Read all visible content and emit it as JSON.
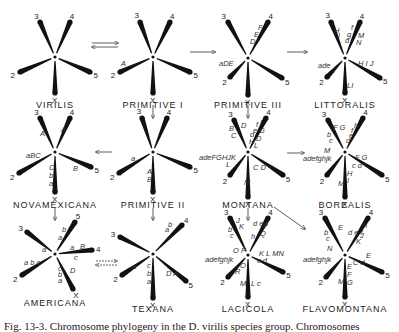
{
  "caption": "Fig. 13-3. Chromosome phylogeny in the D. virilis species group. Chromosomes",
  "species": [
    {
      "name": "VIRILIS",
      "cx": 55,
      "cy": 57,
      "arms": [
        {
          "id": "3",
          "x": 40,
          "y": 22
        },
        {
          "id": "4",
          "x": 70,
          "y": 22
        },
        {
          "id": "2",
          "x": 20,
          "y": 72
        },
        {
          "id": "5",
          "x": 90,
          "y": 72
        },
        {
          "id": "X",
          "x": 55,
          "y": 93
        }
      ],
      "labels": []
    },
    {
      "name": "PRIMITIVE I",
      "cx": 153,
      "cy": 57,
      "arms": [
        {
          "id": "3",
          "x": 140,
          "y": 22
        },
        {
          "id": "4",
          "x": 170,
          "y": 22
        },
        {
          "id": "2",
          "x": 120,
          "y": 72
        },
        {
          "id": "5",
          "x": 190,
          "y": 72
        },
        {
          "id": "X",
          "x": 153,
          "y": 93
        }
      ],
      "labels": [
        {
          "t": "A",
          "x": 121,
          "y": 66
        }
      ]
    },
    {
      "name": "PRIMITIVE III",
      "cx": 248,
      "cy": 58,
      "arms": [
        {
          "id": "3",
          "x": 228,
          "y": 22
        },
        {
          "id": "4",
          "x": 268,
          "y": 22
        },
        {
          "id": "2",
          "x": 230,
          "y": 77
        },
        {
          "id": "5",
          "x": 282,
          "y": 78
        },
        {
          "id": "X",
          "x": 248,
          "y": 95
        }
      ],
      "labels": [
        {
          "t": "F",
          "x": 258,
          "y": 30
        },
        {
          "t": "E",
          "x": 254,
          "y": 37
        },
        {
          "t": "D",
          "x": 250,
          "y": 44
        },
        {
          "t": "aDE",
          "x": 219,
          "y": 66
        }
      ]
    },
    {
      "name": "LITTORALIS",
      "cx": 345,
      "cy": 58,
      "arms": [
        {
          "id": "3",
          "x": 331,
          "y": 22
        },
        {
          "id": "4",
          "x": 360,
          "y": 22
        },
        {
          "id": "2",
          "x": 327,
          "y": 77
        },
        {
          "id": "5",
          "x": 380,
          "y": 78
        },
        {
          "id": "X",
          "x": 345,
          "y": 93
        }
      ],
      "labels": [
        {
          "t": "H",
          "x": 334,
          "y": 33
        },
        {
          "t": "I",
          "x": 338,
          "y": 38
        },
        {
          "t": "f",
          "x": 351,
          "y": 30
        },
        {
          "t": "g",
          "x": 347,
          "y": 37
        },
        {
          "t": "d",
          "x": 345,
          "y": 43
        },
        {
          "t": "M",
          "x": 358,
          "y": 38
        },
        {
          "t": "N",
          "x": 356,
          "y": 45
        },
        {
          "t": "ade",
          "x": 318,
          "y": 68
        },
        {
          "t": "I",
          "x": 333,
          "y": 73
        },
        {
          "t": "H I J",
          "x": 358,
          "y": 66
        },
        {
          "t": "LI",
          "x": 347,
          "y": 88
        }
      ]
    },
    {
      "name": "NOVAMEXICANA",
      "cx": 55,
      "cy": 152,
      "arms": [
        {
          "id": "3",
          "x": 40,
          "y": 118
        },
        {
          "id": "4",
          "x": 70,
          "y": 118
        },
        {
          "id": "2",
          "x": 19,
          "y": 173
        },
        {
          "id": "5",
          "x": 91,
          "y": 167
        },
        {
          "id": "X",
          "x": 55,
          "y": 192
        }
      ],
      "labels": [
        {
          "t": "A",
          "x": 40,
          "y": 136
        },
        {
          "t": "A",
          "x": 61,
          "y": 132
        },
        {
          "t": "aBC",
          "x": 26,
          "y": 158
        },
        {
          "t": "C",
          "x": 49,
          "y": 170
        },
        {
          "t": "b",
          "x": 49,
          "y": 178
        },
        {
          "t": "a",
          "x": 49,
          "y": 186
        },
        {
          "t": "B",
          "x": 73,
          "y": 171
        }
      ]
    },
    {
      "name": "PRIMITIVE II",
      "cx": 153,
      "cy": 152,
      "arms": [
        {
          "id": "3",
          "x": 142,
          "y": 118
        },
        {
          "id": "4",
          "x": 167,
          "y": 118
        },
        {
          "id": "2",
          "x": 119,
          "y": 173
        },
        {
          "id": "5",
          "x": 190,
          "y": 167
        },
        {
          "id": "X",
          "x": 153,
          "y": 192
        }
      ],
      "labels": [
        {
          "t": "a",
          "x": 131,
          "y": 161
        },
        {
          "t": "A",
          "x": 147,
          "y": 174
        },
        {
          "t": "B",
          "x": 147,
          "y": 182
        }
      ]
    },
    {
      "name": "MONTANA",
      "cx": 248,
      "cy": 152,
      "arms": [
        {
          "id": "3",
          "x": 234,
          "y": 120
        },
        {
          "id": "4",
          "x": 266,
          "y": 118
        },
        {
          "id": "2",
          "x": 230,
          "y": 175
        },
        {
          "id": "5",
          "x": 283,
          "y": 175
        },
        {
          "id": "X",
          "x": 248,
          "y": 197
        }
      ],
      "labels": [
        {
          "t": "B",
          "x": 229,
          "y": 131
        },
        {
          "t": "C",
          "x": 231,
          "y": 138
        },
        {
          "t": "D",
          "x": 241,
          "y": 128
        },
        {
          "t": "d",
          "x": 250,
          "y": 137
        },
        {
          "t": "e",
          "x": 253,
          "y": 133
        },
        {
          "t": "f",
          "x": 256,
          "y": 127
        },
        {
          "t": "I",
          "x": 260,
          "y": 125
        },
        {
          "t": "G",
          "x": 259,
          "y": 133
        },
        {
          "t": "H",
          "x": 249,
          "y": 144
        },
        {
          "t": "D",
          "x": 256,
          "y": 141
        },
        {
          "t": "L",
          "x": 254,
          "y": 148
        },
        {
          "t": "adeFGHJK",
          "x": 199,
          "y": 160
        },
        {
          "t": "L",
          "x": 226,
          "y": 167
        },
        {
          "t": "C D",
          "x": 253,
          "y": 170
        },
        {
          "t": "M",
          "x": 244,
          "y": 185
        }
      ]
    },
    {
      "name": "BOREALIS",
      "cx": 345,
      "cy": 152,
      "arms": [
        {
          "id": "3",
          "x": 328,
          "y": 120
        },
        {
          "id": "4",
          "x": 363,
          "y": 118
        },
        {
          "id": "2",
          "x": 327,
          "y": 175
        },
        {
          "id": "5",
          "x": 382,
          "y": 175
        },
        {
          "id": "X",
          "x": 345,
          "y": 197
        }
      ],
      "labels": [
        {
          "t": "F G",
          "x": 333,
          "y": 130
        },
        {
          "t": "b",
          "x": 327,
          "y": 137
        },
        {
          "t": "c",
          "x": 329,
          "y": 143
        },
        {
          "t": "h",
          "x": 354,
          "y": 128
        },
        {
          "t": "f",
          "x": 351,
          "y": 133
        },
        {
          "t": "e",
          "x": 349,
          "y": 138
        },
        {
          "t": "d",
          "x": 346,
          "y": 143
        },
        {
          "t": "M",
          "x": 324,
          "y": 153
        },
        {
          "t": "adefghjk",
          "x": 303,
          "y": 161
        },
        {
          "t": "F G",
          "x": 355,
          "y": 160
        },
        {
          "t": "c d",
          "x": 352,
          "y": 168
        },
        {
          "t": "H",
          "x": 347,
          "y": 176
        },
        {
          "t": "I",
          "x": 347,
          "y": 183
        },
        {
          "t": "M",
          "x": 338,
          "y": 186
        }
      ]
    },
    {
      "name": "AMERICANA",
      "cx": 55,
      "cy": 254,
      "arms": [
        {
          "id": "3",
          "x": 27,
          "y": 232
        },
        {
          "id": "5",
          "x": 75,
          "y": 222
        },
        {
          "id": "4",
          "x": 92,
          "y": 250
        },
        {
          "id": "2",
          "x": 22,
          "y": 275
        },
        {
          "id": "X",
          "x": 73,
          "y": 289
        }
      ],
      "labels": [
        {
          "t": "b",
          "x": 62,
          "y": 232
        },
        {
          "t": "a",
          "x": 58,
          "y": 240
        },
        {
          "t": "a",
          "x": 42,
          "y": 252
        },
        {
          "t": "a b c",
          "x": 24,
          "y": 265
        },
        {
          "t": "a",
          "x": 70,
          "y": 250
        },
        {
          "t": "B",
          "x": 80,
          "y": 249
        },
        {
          "t": "c",
          "x": 74,
          "y": 260
        },
        {
          "t": "c",
          "x": 58,
          "y": 271
        },
        {
          "t": "b",
          "x": 58,
          "y": 277
        },
        {
          "t": "a",
          "x": 58,
          "y": 283
        },
        {
          "t": "D",
          "x": 70,
          "y": 273
        }
      ]
    },
    {
      "name": "TEXANA",
      "cx": 153,
      "cy": 254,
      "arms": [
        {
          "id": "3",
          "x": 120,
          "y": 237
        },
        {
          "id": "4",
          "x": 182,
          "y": 225
        },
        {
          "id": "2",
          "x": 122,
          "y": 275
        },
        {
          "id": "5",
          "x": 186,
          "y": 281
        },
        {
          "id": "X",
          "x": 153,
          "y": 298
        }
      ],
      "labels": [
        {
          "t": "a",
          "x": 165,
          "y": 232
        },
        {
          "t": "b",
          "x": 168,
          "y": 227
        },
        {
          "t": "a",
          "x": 132,
          "y": 269
        },
        {
          "t": "c",
          "x": 147,
          "y": 268
        },
        {
          "t": "b",
          "x": 147,
          "y": 276
        },
        {
          "t": "a",
          "x": 147,
          "y": 284
        },
        {
          "t": "D A",
          "x": 166,
          "y": 276
        }
      ]
    },
    {
      "name": "LACICOLA",
      "cx": 248,
      "cy": 255,
      "arms": [
        {
          "id": "3",
          "x": 230,
          "y": 218
        },
        {
          "id": "4",
          "x": 268,
          "y": 218
        },
        {
          "id": "2",
          "x": 228,
          "y": 277
        },
        {
          "id": "5",
          "x": 283,
          "y": 272
        },
        {
          "id": "X",
          "x": 248,
          "y": 297
        }
      ],
      "labels": [
        {
          "t": "J",
          "x": 236,
          "y": 223
        },
        {
          "t": "K",
          "x": 239,
          "y": 229
        },
        {
          "t": "b",
          "x": 228,
          "y": 232
        },
        {
          "t": "c",
          "x": 230,
          "y": 238
        },
        {
          "t": "d e f",
          "x": 253,
          "y": 226
        },
        {
          "t": "h",
          "x": 251,
          "y": 239
        },
        {
          "t": "P",
          "x": 263,
          "y": 228
        },
        {
          "t": "Q",
          "x": 260,
          "y": 236
        },
        {
          "t": "O P",
          "x": 233,
          "y": 253
        },
        {
          "t": "adefghjk",
          "x": 205,
          "y": 262
        },
        {
          "t": "O",
          "x": 240,
          "y": 268
        },
        {
          "t": "R",
          "x": 235,
          "y": 274
        },
        {
          "t": "K L MN",
          "x": 259,
          "y": 256
        },
        {
          "t": "c d",
          "x": 257,
          "y": 263
        },
        {
          "t": "M",
          "x": 240,
          "y": 286
        },
        {
          "t": "L c",
          "x": 251,
          "y": 286
        }
      ]
    },
    {
      "name": "FLAVOMONTANA",
      "cx": 345,
      "cy": 255,
      "arms": [
        {
          "id": "3",
          "x": 325,
          "y": 218
        },
        {
          "id": "4",
          "x": 368,
          "y": 218
        },
        {
          "id": "2",
          "x": 326,
          "y": 277
        },
        {
          "id": "5",
          "x": 382,
          "y": 272
        },
        {
          "id": "X",
          "x": 345,
          "y": 297
        }
      ],
      "labels": [
        {
          "t": "E",
          "x": 338,
          "y": 230
        },
        {
          "t": "b",
          "x": 324,
          "y": 235
        },
        {
          "t": "c",
          "x": 326,
          "y": 241
        },
        {
          "t": "h",
          "x": 363,
          "y": 228
        },
        {
          "t": "d e f",
          "x": 348,
          "y": 235
        },
        {
          "t": "J",
          "x": 360,
          "y": 238
        },
        {
          "t": "K",
          "x": 356,
          "y": 244
        },
        {
          "t": "N",
          "x": 327,
          "y": 251
        },
        {
          "t": "adefghjk",
          "x": 303,
          "y": 262
        },
        {
          "t": "E",
          "x": 366,
          "y": 258
        },
        {
          "t": "C d",
          "x": 353,
          "y": 265
        },
        {
          "t": "E",
          "x": 347,
          "y": 269
        },
        {
          "t": "F",
          "x": 347,
          "y": 277
        },
        {
          "t": "G",
          "x": 347,
          "y": 285
        },
        {
          "t": "M",
          "x": 338,
          "y": 284
        }
      ]
    }
  ],
  "arrows": [
    {
      "type": "double",
      "x1": 92,
      "y1": 45,
      "x2": 118,
      "y2": 45
    },
    {
      "type": "single",
      "x1": 190,
      "y1": 52,
      "x2": 215,
      "y2": 52
    },
    {
      "type": "single",
      "x1": 287,
      "y1": 52,
      "x2": 307,
      "y2": 52
    },
    {
      "type": "single",
      "x1": 153,
      "y1": 105,
      "x2": 153,
      "y2": 118
    },
    {
      "type": "single",
      "x1": 248,
      "y1": 105,
      "x2": 248,
      "y2": 118
    },
    {
      "type": "single",
      "x1": 112,
      "y1": 152,
      "x2": 96,
      "y2": 152
    },
    {
      "type": "single",
      "x1": 287,
      "y1": 153,
      "x2": 304,
      "y2": 153
    },
    {
      "type": "single",
      "x1": 55,
      "y1": 208,
      "x2": 55,
      "y2": 220
    },
    {
      "type": "single",
      "x1": 153,
      "y1": 208,
      "x2": 153,
      "y2": 220
    },
    {
      "type": "single",
      "x1": 248,
      "y1": 208,
      "x2": 248,
      "y2": 220
    },
    {
      "type": "single",
      "x1": 274,
      "y1": 207,
      "x2": 305,
      "y2": 229
    },
    {
      "type": "dashed-double",
      "x1": 96,
      "y1": 263,
      "x2": 117,
      "y2": 263
    }
  ]
}
